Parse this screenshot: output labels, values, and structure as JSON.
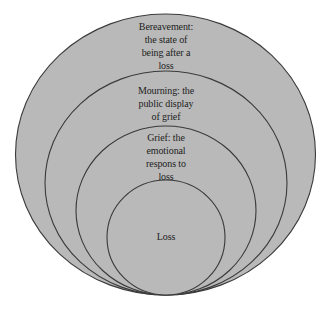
{
  "diagram": {
    "type": "nested-circles",
    "colors": {
      "fill": "#b9b9b9",
      "stroke": "#3a3a3a",
      "text": "#222222",
      "background": "#ffffff"
    },
    "layers": [
      {
        "id": "bereavement",
        "label_lines": [
          "Bereavement:",
          "the state of",
          "being after a",
          "loss"
        ]
      },
      {
        "id": "mourning",
        "label_lines": [
          "Mourning: the",
          "public display",
          "of grief"
        ]
      },
      {
        "id": "grief",
        "label_lines": [
          "Grief: the",
          "emotional",
          "respons to",
          "loss"
        ]
      },
      {
        "id": "loss",
        "label_lines": [
          "Loss"
        ]
      }
    ]
  }
}
